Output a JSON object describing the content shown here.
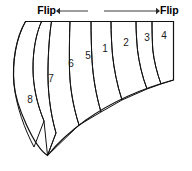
{
  "figure": {
    "type": "diagram",
    "title": "",
    "background": "#ffffff",
    "outline_color": "#111111"
  },
  "annotations": {
    "left": {
      "label": "Flip",
      "arrow": "arrow-left-icon",
      "direction": "left",
      "label_x": 56,
      "label_y": 11,
      "line_x1": 60,
      "line_x2": 88,
      "line_y": 11
    },
    "right": {
      "label": "Flip",
      "arrow": "arrow-right-icon",
      "direction": "right",
      "label_x": 160,
      "label_y": 11,
      "line_x1": 104,
      "line_x2": 156,
      "line_y": 11
    }
  },
  "bands": [
    {
      "number": "8",
      "fill": "#b4b4b4",
      "label_x": 30,
      "label_y": 100,
      "path": "M 25.5,21.5 C 16,38 12,62 14,84 C 16,106 25,130 34,147 L 44,121 C 37,104 33,86 33,68 C 33,50 36,34 41.5,21.5 Z"
    },
    {
      "number": "7",
      "fill": "#9a9a9a",
      "label_x": 51,
      "label_y": 79,
      "path": "M 41.5,21.5 C 36,34 33,50 33,68 C 33,86 37,104 44,121 L 47.5,155.5 L 56,133 C 50,112 47.5,90 48,68 C 48.3,51 49.5,34 51.5,21.5 Z"
    },
    {
      "number": "6",
      "fill": "#a8a8a8",
      "label_x": 71,
      "label_y": 64,
      "path": "M 51.5,21.5 C 49.5,34 48.3,51 48,68 C 47.5,90 50,112 56,133 L 47.5,155.5 L 79,125 C 73,106 70,88 69.5,70 C 69.2,53 69.5,35 70,21.5 Z"
    },
    {
      "number": "5",
      "fill": "#dedede",
      "label_x": 88,
      "label_y": 56,
      "path": "M 70,21.5 C 69.5,35 69.2,53 69.5,70 C 70,88 73,106 79,125 L 101,112 C 96,95 93,77 92,60 C 91.4,47 91,33 91,21.5 Z"
    },
    {
      "number": "1",
      "fill": "#c4c4c4",
      "label_x": 105,
      "label_y": 49,
      "path": "M 91,21.5 C 91,33 91.4,47 92,60 C 93,77 96,95 101,112 L 122,100 C 117,85 114,69 112.5,55 C 111.6,44 111,32 111,21.5 Z"
    },
    {
      "number": "2",
      "fill": "#8e8e8e",
      "label_x": 126,
      "label_y": 43,
      "path": "M 111,21.5 C 111,32 111.6,44 112.5,55 C 114,69 117,85 122,100 L 147,89 C 142,76 139,62 137.5,50 C 136.7,41 136,31 136,21.5 Z"
    },
    {
      "number": "3",
      "fill": "#b0b0b0",
      "label_x": 147,
      "label_y": 38,
      "path": "M 136,21.5 C 136,31 136.7,41 137.5,50 C 139,62 142,76 147,89 L 161,84 C 157,73 154,61 152.8,50 C 152.2,41 152,30 152,21.5 Z"
    },
    {
      "number": "4",
      "fill": "#dcdcdc",
      "label_x": 164,
      "label_y": 36,
      "path": "M 152,21.5 C 152,30 152.2,41 152.8,50 C 154,61 157,73 161,84 L 173.5,80 L 173.5,21.5 Z"
    }
  ],
  "outline": {
    "path": "M 25.5,21.5 L 173.5,21.5 L 173.5,80 C 140,89 110,103 86,120 C 68,133 55,146 47.5,155.5 C 34,147 16,106 14,84 C 12,62 16,38 25.5,21.5 Z"
  }
}
